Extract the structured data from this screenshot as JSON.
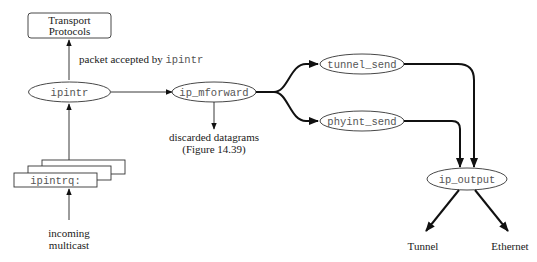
{
  "diagram": {
    "type": "flow",
    "nodes": {
      "transport": {
        "line1": "Transport",
        "line2": "Protocols"
      },
      "ipintr": {
        "label": "ipintr"
      },
      "ip_mforward": {
        "label": "ip_mforward"
      },
      "tunnel_send": {
        "label": "tunnel_send"
      },
      "phyint_send": {
        "label": "phyint_send"
      },
      "ip_output": {
        "label": "ip_output"
      },
      "ipintrq": {
        "label": "ipintrq:"
      }
    },
    "labels": {
      "accepted_prefix": "packet accepted by ",
      "accepted_code": "ipintr",
      "discarded_line1": "discarded datagrams",
      "discarded_line2": "(Figure 14.39)",
      "incoming_line1": "incoming",
      "incoming_line2": "multicast",
      "tunnel": "Tunnel",
      "ethernet": "Ethernet"
    },
    "edges": [
      {
        "from": "incoming multicast",
        "to": "ipintrq"
      },
      {
        "from": "ipintrq",
        "to": "ipintr"
      },
      {
        "from": "ipintr",
        "to": "Transport Protocols",
        "label": "packet accepted by ipintr"
      },
      {
        "from": "ipintr",
        "to": "ip_mforward"
      },
      {
        "from": "ip_mforward",
        "to": "discarded datagrams (Figure 14.39)"
      },
      {
        "from": "ip_mforward",
        "to": "tunnel_send"
      },
      {
        "from": "ip_mforward",
        "to": "phyint_send"
      },
      {
        "from": "tunnel_send",
        "to": "ip_output"
      },
      {
        "from": "phyint_send",
        "to": "ip_output"
      },
      {
        "from": "ip_output",
        "to": "Tunnel"
      },
      {
        "from": "ip_output",
        "to": "Ethernet"
      }
    ]
  }
}
